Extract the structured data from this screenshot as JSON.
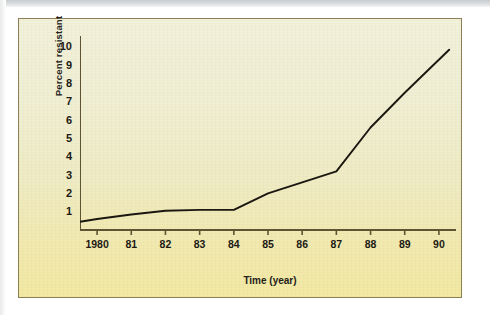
{
  "figure": {
    "frame_border_color": "#8a7f55",
    "background_top_color": "#f2f1da",
    "background_bottom_color": "#f3e9a4",
    "line_color": "#1a1710"
  },
  "chart_data": {
    "type": "line",
    "title": "",
    "subtitle": "",
    "xlabel": "Time (year)",
    "ylabel": "Percent resistant",
    "grid": false,
    "legend": "none",
    "xlim": [
      1979.5,
      1990.5
    ],
    "ylim": [
      0,
      10.6
    ],
    "x": [
      1979.5,
      1980,
      1981,
      1982,
      1983,
      1984,
      1985,
      1986,
      1987,
      1988,
      1989,
      1990.3
    ],
    "x_tick_labels": [
      "1980",
      "81",
      "82",
      "83",
      "84",
      "85",
      "86",
      "87",
      "88",
      "89",
      "90"
    ],
    "x_tick_values": [
      1980,
      1981,
      1982,
      1983,
      1984,
      1985,
      1986,
      1987,
      1988,
      1989,
      1990
    ],
    "y_tick_labels": [
      "1",
      "2",
      "3",
      "4",
      "5",
      "6",
      "7",
      "8",
      "9",
      "10"
    ],
    "y_tick_values": [
      1,
      2,
      3,
      4,
      5,
      6,
      7,
      8,
      9,
      10
    ],
    "series": [
      {
        "name": "Percent resistant",
        "values": [
          0.45,
          0.6,
          0.85,
          1.05,
          1.1,
          1.1,
          2.0,
          2.6,
          3.2,
          5.6,
          7.5,
          9.85
        ]
      }
    ]
  }
}
